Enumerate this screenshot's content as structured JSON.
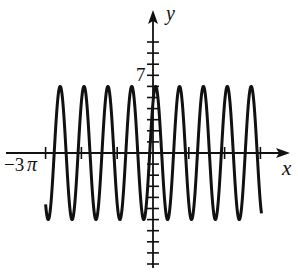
{
  "chart_data": {
    "type": "line",
    "title": "",
    "xlabel": "x",
    "ylabel": "y",
    "x_tick_labels": [
      "-3π"
    ],
    "y_tick_labels": [
      "7"
    ],
    "x_ticks_pi": [
      -3,
      -2,
      -1,
      1,
      2,
      3
    ],
    "y_ticks": [
      -10,
      -9,
      -8,
      -7,
      -6,
      -5,
      -4,
      -3,
      -2,
      -1,
      1,
      2,
      3,
      4,
      5,
      6,
      7,
      8,
      9,
      10
    ],
    "xlim": [
      -3.4,
      3.7
    ],
    "xlim_units": "π",
    "ylim": [
      -10.5,
      13
    ],
    "grid": false,
    "legend": "none",
    "series": [
      {
        "name": "curve",
        "function": "y ≈ 6·cos(3x) with slight phase shift (periodic, period ≈ 2π/3)",
        "amplitude": 6,
        "period_pi": 0.667,
        "x_start_pi": -3,
        "x_end_pi": 3.03,
        "y_max": 6,
        "y_min": -6,
        "peak_count": 9,
        "trough_count": 9
      }
    ]
  },
  "labels": {
    "x_axis": "x",
    "y_axis": "y",
    "y_tick_label": "7",
    "x_tick_label_minus": "−3",
    "x_tick_label_pi": "π"
  },
  "colors": {
    "ink": "#111111",
    "background": "#ffffff"
  }
}
